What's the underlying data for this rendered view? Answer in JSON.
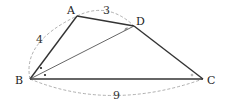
{
  "diagram": {
    "type": "geometry-quadrilateral",
    "points": {
      "A": {
        "label": "A",
        "x": 77,
        "y": 16
      },
      "B": {
        "label": "B",
        "x": 30,
        "y": 79
      },
      "C": {
        "label": "C",
        "x": 203,
        "y": 79
      },
      "D": {
        "label": "D",
        "x": 134,
        "y": 26
      }
    },
    "segments": [
      {
        "from": "A",
        "to": "B"
      },
      {
        "from": "A",
        "to": "D"
      },
      {
        "from": "D",
        "to": "C"
      },
      {
        "from": "B",
        "to": "C"
      },
      {
        "from": "B",
        "to": "D"
      }
    ],
    "measurements": {
      "AB": "4",
      "AD": "3",
      "BC": "9"
    },
    "angle_marks": {
      "B_upper": "dot",
      "B_lower": "dot",
      "D": "arc",
      "C": "arc"
    },
    "colors": {
      "line": "#333333",
      "dashed": "#999999",
      "text": "#222222"
    }
  }
}
